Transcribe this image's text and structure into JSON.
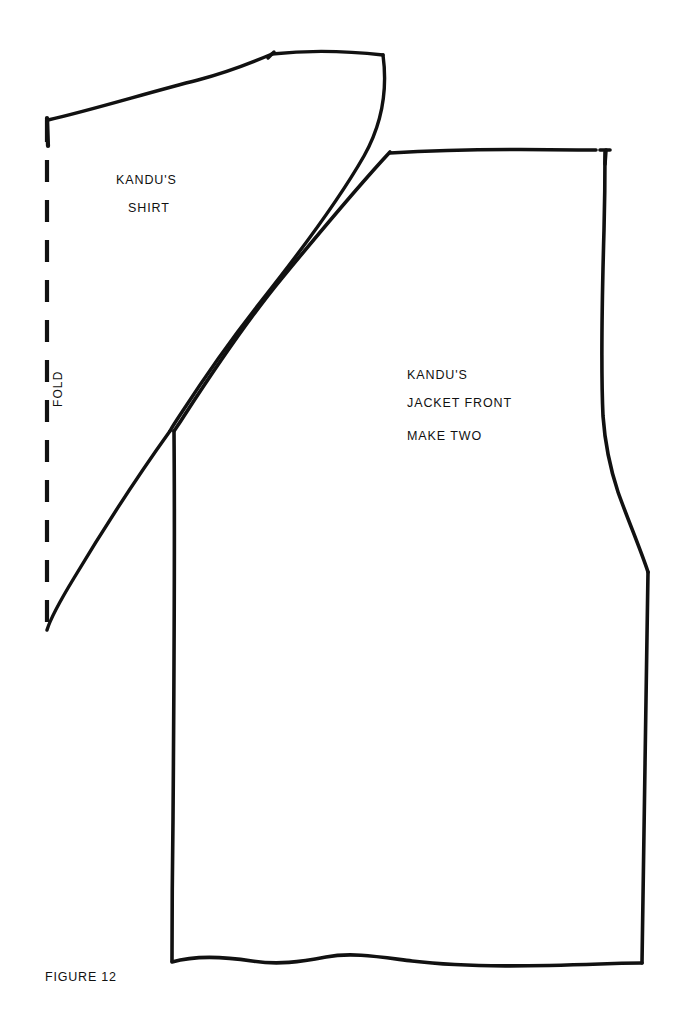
{
  "figure": {
    "caption": "FIGURE 12",
    "background_color": "#ffffff",
    "ink_color": "#111111"
  },
  "pieces": {
    "shirt": {
      "title_line_1": "KANDU'S",
      "title_line_2": "SHIRT",
      "fold_label": "FOLD",
      "fold_edge_style": "dashed"
    },
    "jacket": {
      "title_line_1": "KANDU'S",
      "title_line_2": "JACKET  FRONT",
      "instruction": "MAKE TWO"
    }
  }
}
